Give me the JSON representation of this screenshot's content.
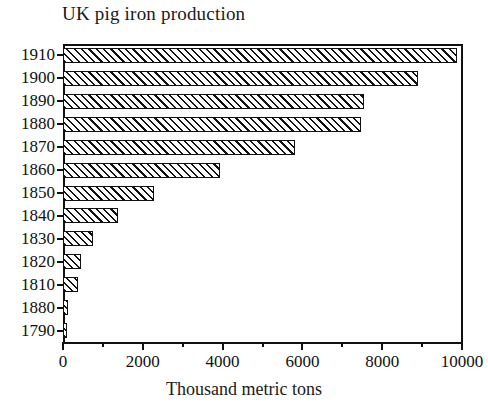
{
  "chart_data": {
    "type": "bar",
    "orientation": "horizontal",
    "title": "UK pig iron production",
    "xlabel": "Thousand metric tons",
    "ylabel": "",
    "categories": [
      "1910",
      "1900",
      "1890",
      "1880",
      "1870",
      "1860",
      "1850",
      "1840",
      "1830",
      "1820",
      "1810",
      "1880",
      "1790"
    ],
    "values": [
      9870,
      8890,
      7545,
      7470,
      5815,
      3935,
      2280,
      1380,
      750,
      450,
      375,
      130,
      100
    ],
    "xlim": [
      0,
      10000
    ],
    "x_ticks": [
      0,
      2000,
      4000,
      6000,
      8000,
      10000
    ],
    "x_tick_labels": [
      "0",
      "2000",
      "4000",
      "6000",
      "8000",
      "10000"
    ],
    "x_minor_ticks": [
      1000,
      3000,
      5000,
      7000,
      9000
    ],
    "grid": false,
    "legend": null,
    "bar_style": {
      "fill": "diagonal-hatch",
      "edge_color": "#111111",
      "face_color": "#ffffff"
    }
  },
  "figure": {
    "background": "#ffffff",
    "foreground": "#111111"
  }
}
